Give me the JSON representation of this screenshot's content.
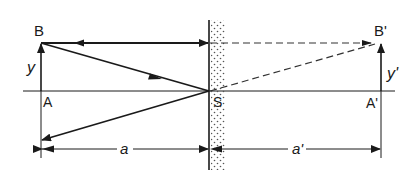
{
  "diagram": {
    "type": "plane-mirror-image-formation",
    "labels": {
      "B": "B",
      "A": "A",
      "y": "y",
      "S": "S",
      "B_prime": "B'",
      "A_prime": "A'",
      "y_prime": "y'",
      "a": "a",
      "a_prime": "a'"
    },
    "colors": {
      "line": "#1a1a1a",
      "dashed": "#333333",
      "mirror_dots": "#555555",
      "background": "#ffffff"
    }
  }
}
